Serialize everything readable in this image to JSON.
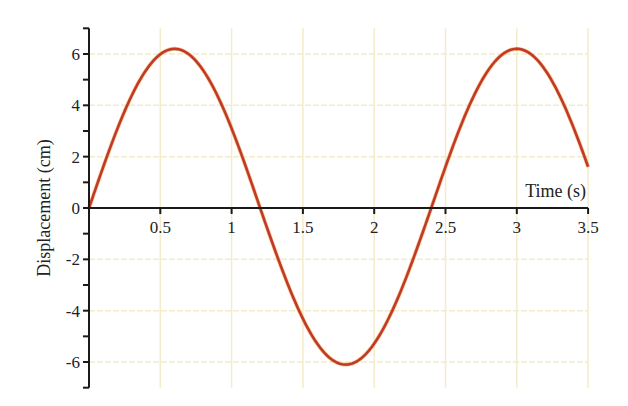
{
  "chart_data": {
    "type": "line",
    "title": "",
    "xlabel": "Time (s)",
    "ylabel": "Displacement (cm)",
    "xlim": [
      0,
      3.5
    ],
    "ylim": [
      -7,
      7
    ],
    "x_ticks": [
      0.5,
      1,
      1.5,
      2,
      2.5,
      3,
      3.5
    ],
    "x_tick_labels": [
      "0.5",
      "1",
      "1.5",
      "2",
      "2.5",
      "3",
      "3.5"
    ],
    "y_ticks": [
      -6,
      -4,
      -2,
      0,
      2,
      4,
      6
    ],
    "y_tick_labels": [
      "-6",
      "-4",
      "-2",
      "0",
      "2",
      "4",
      "6"
    ],
    "grid": true,
    "legend": null,
    "series": [
      {
        "name": "displacement",
        "color": "#c0392b",
        "function": "A*sin(2*pi*t/T)",
        "amplitude": 6.2,
        "period": 2.4,
        "x": [
          0,
          0.3,
          0.6,
          0.9,
          1.2,
          1.5,
          1.8,
          2.1,
          2.4,
          2.7,
          3.0,
          3.3,
          3.5
        ],
        "values": [
          0,
          4.4,
          6.2,
          4.4,
          0,
          -4.4,
          -6.1,
          -4.4,
          0,
          4.4,
          6.2,
          4.4,
          2.0
        ]
      }
    ]
  },
  "colors": {
    "grid": "#f2eccb",
    "axis": "#1a1a1a",
    "curve": "#c0392b",
    "curve_highlight": "#f0a030"
  }
}
